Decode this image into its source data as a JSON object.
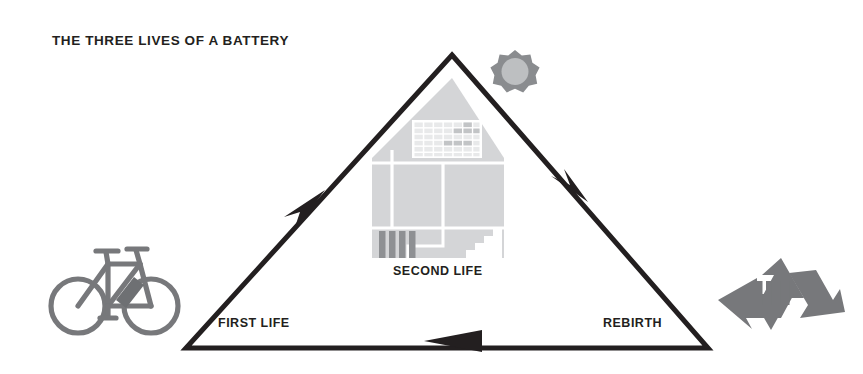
{
  "title": "THE THREE LIVES OF A BATTERY",
  "labels": {
    "first_life": "FIRST LIFE",
    "second_life": "SECOND LIFE",
    "rebirth": "REBIRTH"
  },
  "icons": {
    "bicycle": "bicycle-icon",
    "house": "house-icon",
    "solar_panel": "solar-panel-icon",
    "battery_storage": "battery-storage-icon",
    "stairs": "stairs-icon",
    "sun": "sun-icon",
    "recycling": "recycling-icon"
  },
  "colors": {
    "ink": "#231f20",
    "icon_gray": "#77787b",
    "house_fill": "#d4d5d7",
    "house_line": "#ffffff",
    "panel_cell": "#e8e9ea",
    "panel_cell_dark": "#c2c4c6",
    "battery_bar": "#8e9093",
    "sun_ray": "#8a8c8f",
    "sun_core": "#bdbfc1",
    "background": "#ffffff"
  },
  "diagram": {
    "type": "cycle",
    "shape": "triangle",
    "direction": "clockwise",
    "vertices": {
      "apex": [
        452,
        55
      ],
      "bottom_left": [
        186,
        348
      ],
      "bottom_right": [
        708,
        348
      ]
    },
    "stages": [
      {
        "label": "FIRST LIFE",
        "icon": "bicycle-icon",
        "edge": "left"
      },
      {
        "label": "SECOND LIFE",
        "icon": "house-icon",
        "edge": "right"
      },
      {
        "label": "REBIRTH",
        "icon": "recycling-icon",
        "edge": "bottom"
      }
    ],
    "arrows": [
      {
        "edge": "left",
        "points_toward": "apex"
      },
      {
        "edge": "right",
        "points_toward": "bottom-right"
      },
      {
        "edge": "bottom",
        "points_toward": "bottom-left"
      }
    ]
  }
}
